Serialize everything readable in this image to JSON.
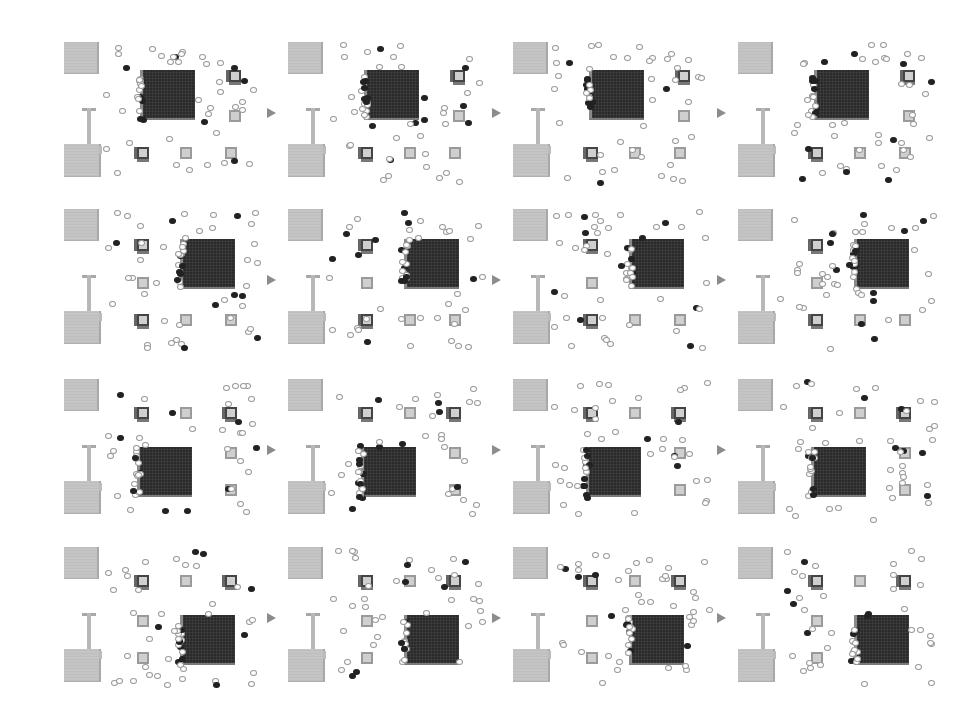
{
  "figure": {
    "rows": 4,
    "cols": 4,
    "colors": {
      "background": "#ffffff",
      "grey_block": "#c4c4c4",
      "dark_block": "#2a2a2a",
      "small_box": "#cfcfcf",
      "agent_hollow": "#999999",
      "agent_filled": "#222222",
      "arrow": "#8c8c8c"
    },
    "panels": [
      {
        "row": 0,
        "col": 0,
        "dark_block": {
          "x": 78,
          "y": 30,
          "w": 52,
          "h": 48
        },
        "boxes": [
          [
            167,
            30
          ],
          [
            167,
            70
          ],
          [
            75,
            107
          ],
          [
            118,
            107
          ],
          [
            163,
            107
          ]
        ]
      },
      {
        "row": 0,
        "col": 1,
        "dark_block": {
          "x": 78,
          "y": 30,
          "w": 52,
          "h": 48
        },
        "boxes": [
          [
            167,
            30
          ],
          [
            167,
            70
          ],
          [
            75,
            107
          ],
          [
            118,
            107
          ],
          [
            163,
            107
          ]
        ]
      },
      {
        "row": 0,
        "col": 2,
        "dark_block": {
          "x": 78,
          "y": 30,
          "w": 52,
          "h": 48
        },
        "boxes": [
          [
            167,
            30
          ],
          [
            167,
            70
          ],
          [
            75,
            107
          ],
          [
            118,
            107
          ],
          [
            163,
            107
          ]
        ]
      },
      {
        "row": 0,
        "col": 3,
        "dark_block": {
          "x": 78,
          "y": 30,
          "w": 52,
          "h": 48
        },
        "boxes": [
          [
            167,
            30
          ],
          [
            167,
            70
          ],
          [
            75,
            107
          ],
          [
            118,
            107
          ],
          [
            163,
            107
          ]
        ]
      },
      {
        "row": 1,
        "col": 0,
        "dark_block": {
          "x": 118,
          "y": 32,
          "w": 52,
          "h": 48
        },
        "boxes": [
          [
            75,
            32
          ],
          [
            75,
            70
          ],
          [
            75,
            107
          ],
          [
            118,
            107
          ],
          [
            163,
            107
          ]
        ]
      },
      {
        "row": 1,
        "col": 1,
        "dark_block": {
          "x": 118,
          "y": 32,
          "w": 52,
          "h": 48
        },
        "boxes": [
          [
            75,
            32
          ],
          [
            75,
            70
          ],
          [
            75,
            107
          ],
          [
            118,
            107
          ],
          [
            163,
            107
          ]
        ]
      },
      {
        "row": 1,
        "col": 2,
        "dark_block": {
          "x": 118,
          "y": 32,
          "w": 52,
          "h": 48
        },
        "boxes": [
          [
            75,
            32
          ],
          [
            75,
            70
          ],
          [
            75,
            107
          ],
          [
            118,
            107
          ],
          [
            163,
            107
          ]
        ]
      },
      {
        "row": 1,
        "col": 3,
        "dark_block": {
          "x": 118,
          "y": 32,
          "w": 52,
          "h": 48
        },
        "boxes": [
          [
            75,
            32
          ],
          [
            75,
            70
          ],
          [
            75,
            107
          ],
          [
            118,
            107
          ],
          [
            163,
            107
          ]
        ]
      },
      {
        "row": 2,
        "col": 0,
        "dark_block": {
          "x": 75,
          "y": 70,
          "w": 52,
          "h": 48
        },
        "boxes": [
          [
            75,
            30
          ],
          [
            118,
            30
          ],
          [
            163,
            30
          ],
          [
            163,
            70
          ],
          [
            163,
            107
          ]
        ]
      },
      {
        "row": 2,
        "col": 1,
        "dark_block": {
          "x": 75,
          "y": 70,
          "w": 52,
          "h": 48
        },
        "boxes": [
          [
            75,
            30
          ],
          [
            118,
            30
          ],
          [
            163,
            30
          ],
          [
            163,
            70
          ],
          [
            163,
            107
          ]
        ]
      },
      {
        "row": 2,
        "col": 2,
        "dark_block": {
          "x": 75,
          "y": 70,
          "w": 52,
          "h": 48
        },
        "boxes": [
          [
            75,
            30
          ],
          [
            118,
            30
          ],
          [
            163,
            30
          ],
          [
            163,
            70
          ],
          [
            163,
            107
          ]
        ]
      },
      {
        "row": 2,
        "col": 3,
        "dark_block": {
          "x": 75,
          "y": 70,
          "w": 52,
          "h": 48
        },
        "boxes": [
          [
            75,
            30
          ],
          [
            118,
            30
          ],
          [
            163,
            30
          ],
          [
            163,
            70
          ],
          [
            163,
            107
          ]
        ]
      },
      {
        "row": 3,
        "col": 0,
        "dark_block": {
          "x": 118,
          "y": 70,
          "w": 52,
          "h": 48
        },
        "boxes": [
          [
            75,
            30
          ],
          [
            118,
            30
          ],
          [
            163,
            30
          ],
          [
            75,
            70
          ],
          [
            75,
            107
          ]
        ]
      },
      {
        "row": 3,
        "col": 1,
        "dark_block": {
          "x": 118,
          "y": 70,
          "w": 52,
          "h": 48
        },
        "boxes": [
          [
            75,
            30
          ],
          [
            118,
            30
          ],
          [
            163,
            30
          ],
          [
            75,
            70
          ],
          [
            75,
            107
          ]
        ]
      },
      {
        "row": 3,
        "col": 2,
        "dark_block": {
          "x": 118,
          "y": 70,
          "w": 52,
          "h": 48
        },
        "boxes": [
          [
            75,
            30
          ],
          [
            118,
            30
          ],
          [
            163,
            30
          ],
          [
            75,
            70
          ],
          [
            75,
            107
          ]
        ]
      },
      {
        "row": 3,
        "col": 3,
        "dark_block": {
          "x": 118,
          "y": 70,
          "w": 52,
          "h": 48
        },
        "boxes": [
          [
            75,
            30
          ],
          [
            118,
            30
          ],
          [
            163,
            30
          ],
          [
            75,
            70
          ],
          [
            75,
            107
          ]
        ]
      }
    ],
    "layout": {
      "col_x": [
        62,
        286,
        511,
        736
      ],
      "row_y": [
        40,
        207,
        377,
        545
      ],
      "arrow_x": [
        267,
        492,
        717
      ],
      "arrow_row_offset": 68
    }
  }
}
